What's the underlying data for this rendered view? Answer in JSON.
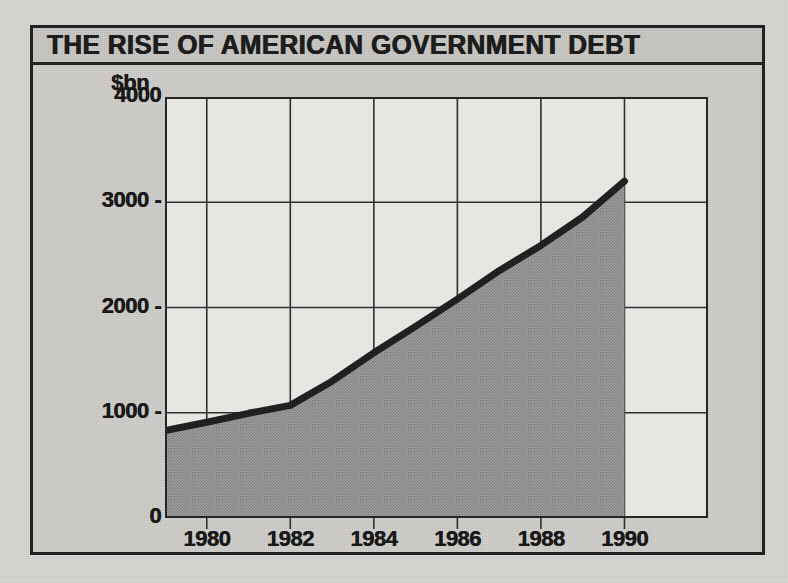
{
  "figure": {
    "title": "THE RISE OF AMERICAN GOVERNMENT DEBT",
    "unit_label": "$bn",
    "border_color": "#1c1c1c",
    "panel_color": "#cfcecb",
    "plot_background": "#efefec",
    "fill_color": "#9a9a9a",
    "line_color": "#1a1a1a"
  },
  "chart_data": {
    "type": "area",
    "title": "THE RISE OF AMERICAN GOVERNMENT DEBT",
    "subtitle": "",
    "xlabel": "",
    "ylabel": "$bn",
    "x": [
      1979,
      1980,
      1981,
      1982,
      1983,
      1984,
      1985,
      1986,
      1987,
      1988,
      1989,
      1990
    ],
    "values": [
      830,
      910,
      995,
      1070,
      1300,
      1570,
      1820,
      2080,
      2350,
      2590,
      2860,
      3200
    ],
    "xlim": [
      1979,
      1992
    ],
    "ylim": [
      0,
      4000
    ],
    "ytick_values": [
      0,
      1000,
      2000,
      3000,
      4000
    ],
    "ytick_labels": [
      "0",
      "1000",
      "2000",
      "3000",
      "4000"
    ],
    "xtick_values": [
      1980,
      1982,
      1984,
      1986,
      1988,
      1990
    ],
    "xtick_labels": [
      "1980",
      "1982",
      "1984",
      "1986",
      "1988",
      "1990"
    ],
    "grid": true,
    "legend": "none",
    "series_name": "US federal government debt"
  }
}
